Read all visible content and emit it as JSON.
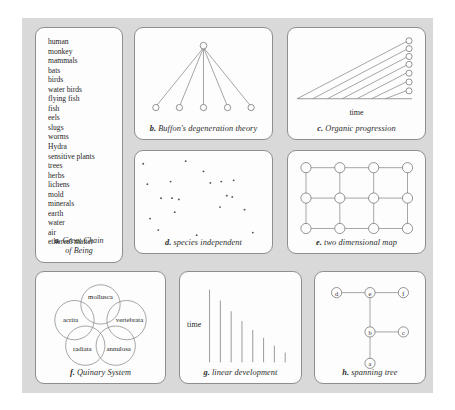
{
  "figure": {
    "background_color": "#ffffff",
    "canvas_color": "#d9d9d9",
    "panel_color": "#fdfdfd",
    "stroke_color": "#8e8e8e",
    "text_color": "#262626"
  },
  "panels": {
    "a": {
      "label": "a.",
      "caption": "Great Chain",
      "caption_line2": "of Being",
      "type": "ordered-list",
      "items": [
        "human",
        "monkey",
        "mammals",
        "bats",
        "birds",
        "water birds",
        "flying fish",
        "fish",
        "eels",
        "slugs",
        "worms",
        "Hydra",
        "sensitive plants",
        "trees",
        "herbs",
        "lichens",
        "mold",
        "minerals",
        "earth",
        "water",
        "air",
        "ethereal matter"
      ]
    },
    "b": {
      "label": "b.",
      "caption": "Buffon's degeneration theory",
      "type": "star-graph",
      "root_node": 1,
      "leaf_nodes": 5,
      "edges": 5
    },
    "c": {
      "label": "c.",
      "caption": "Organic progression",
      "type": "diverging-lines",
      "axis_label": "time",
      "lines": 7,
      "nodes": 7
    },
    "d": {
      "label": "d.",
      "caption": "species independent",
      "type": "scatter",
      "points": [
        [
          6,
          10
        ],
        [
          37,
          8
        ],
        [
          9,
          26
        ],
        [
          26,
          24
        ],
        [
          55,
          25
        ],
        [
          63,
          24
        ],
        [
          72,
          23
        ],
        [
          19,
          37
        ],
        [
          27,
          37
        ],
        [
          32,
          38
        ],
        [
          67,
          35
        ],
        [
          71,
          36
        ],
        [
          29,
          48
        ],
        [
          62,
          44
        ],
        [
          11,
          53
        ],
        [
          45,
          66
        ],
        [
          86,
          64
        ],
        [
          50,
          16
        ],
        [
          17,
          62
        ],
        [
          80,
          46
        ]
      ],
      "point_count": 20
    },
    "e": {
      "label": "e.",
      "caption": "two dimensional map",
      "type": "lattice-grid",
      "columns": 4,
      "rows": 3,
      "node_count": 12
    },
    "f": {
      "label": "f.",
      "caption": "Quinary System",
      "type": "circle-cluster",
      "groups": [
        "mollusca",
        "acrita",
        "vertebrata",
        "radiata",
        "annulosa"
      ]
    },
    "g": {
      "label": "g.",
      "caption": "linear development",
      "type": "descending-bars",
      "axis_label": "time",
      "bar_count": 8,
      "bar_heights": [
        74,
        63,
        52,
        42,
        33,
        25,
        17,
        10
      ]
    },
    "h": {
      "label": "h.",
      "caption": "spanning tree",
      "type": "tree-graph",
      "nodes": [
        "d",
        "e",
        "f",
        "b",
        "c",
        "a"
      ],
      "edges": [
        [
          "d",
          "e"
        ],
        [
          "e",
          "f"
        ],
        [
          "e",
          "b"
        ],
        [
          "b",
          "c"
        ],
        [
          "b",
          "a"
        ]
      ]
    }
  }
}
